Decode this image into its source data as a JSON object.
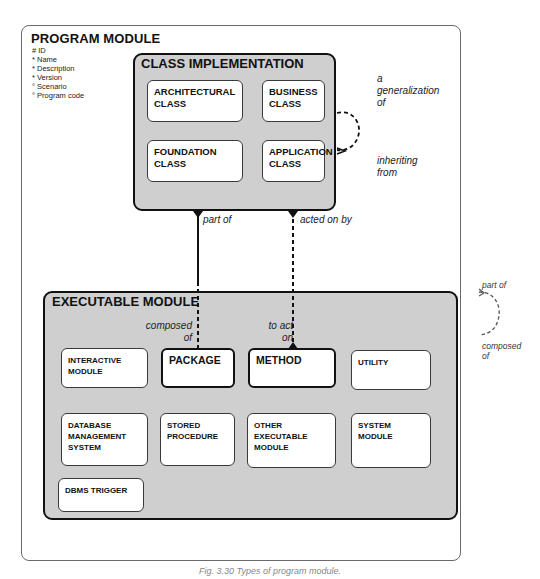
{
  "program_module": {
    "title": "PROGRAM MODULE",
    "attributes": [
      "# ID",
      "* Name",
      "* Description",
      "* Version",
      "° Scenario",
      "° Program code"
    ]
  },
  "class_implementation": {
    "title": "CLASS IMPLEMENTATION",
    "subtypes": [
      {
        "lines": [
          "ARCHITECTURAL",
          "CLASS"
        ]
      },
      {
        "lines": [
          "BUSINESS",
          "CLASS"
        ]
      },
      {
        "lines": [
          "FOUNDATION",
          "CLASS"
        ]
      },
      {
        "lines": [
          "APPLICATION",
          "CLASS"
        ]
      }
    ],
    "self_relationship": {
      "label_top": [
        "a",
        "generalization",
        "of"
      ],
      "label_bottom": [
        "inheriting",
        "from"
      ]
    }
  },
  "executable_module": {
    "title": "EXECUTABLE MODULE",
    "subtypes": [
      {
        "lines": [
          "INTERACTIVE",
          "MODULE"
        ]
      },
      {
        "lines": [
          "PACKAGE"
        ]
      },
      {
        "lines": [
          "METHOD"
        ]
      },
      {
        "lines": [
          "UTILITY"
        ]
      },
      {
        "lines": [
          "DATABASE",
          "MANAGEMENT",
          "SYSTEM"
        ]
      },
      {
        "lines": [
          "STORED",
          "PROCEDURE"
        ]
      },
      {
        "lines": [
          "OTHER",
          "EXECUTABLE",
          "MODULE"
        ]
      },
      {
        "lines": [
          "SYSTEM",
          "MODULE"
        ]
      },
      {
        "lines": [
          "DBMS TRIGGER"
        ]
      }
    ]
  },
  "relationships": {
    "class_package": {
      "top_label": "part of",
      "bottom_label": [
        "composed",
        "of"
      ]
    },
    "class_method": {
      "top_label": "acted on by",
      "bottom_label": [
        "to act",
        "on"
      ]
    },
    "program_module_self": {
      "top_label": "part of",
      "bottom_label": [
        "composed",
        "of"
      ]
    }
  },
  "caption": "Fig. 3.30  Types of program module."
}
